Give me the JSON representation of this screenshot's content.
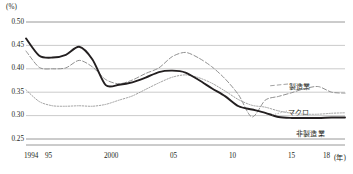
{
  "chart_data": {
    "type": "line",
    "title": "",
    "unit_label": "(%)",
    "xlabel": "(年)",
    "ylabel": "",
    "ylim": [
      0.25,
      0.5
    ],
    "ytick_labels": [
      "0.50",
      "0.45",
      "0.40",
      "0.35",
      "0.30",
      "0.25"
    ],
    "ytick_values": [
      0.5,
      0.45,
      0.4,
      0.35,
      0.3,
      0.25
    ],
    "grid": true,
    "legend_position": "inline-right",
    "xlim": [
      1994,
      2018
    ],
    "x": [
      1994,
      1995,
      1996,
      1997,
      1998,
      1999,
      2000,
      2001,
      2002,
      2003,
      2004,
      2005,
      2006,
      2007,
      2008,
      2009,
      2010,
      2011,
      2012,
      2013,
      2014,
      2015,
      2016,
      2017,
      2018
    ],
    "xtick_labels": [
      "1994",
      "95",
      "2000",
      "05",
      "10",
      "15",
      "18"
    ],
    "xtick_values": [
      1994,
      1995,
      2000,
      2005,
      2010,
      2015,
      2018
    ],
    "xtick_suffix": "(年)",
    "series": [
      {
        "name": "製造業",
        "style": "dashed",
        "color": "#8a8a8a",
        "values": [
          0.438,
          0.403,
          0.4,
          0.402,
          0.418,
          0.404,
          0.377,
          0.368,
          0.376,
          0.39,
          0.402,
          0.426,
          0.435,
          0.423,
          0.404,
          0.378,
          0.344,
          0.297,
          0.333,
          0.341,
          0.349,
          0.358,
          0.362,
          0.35,
          0.348
        ]
      },
      {
        "name": "マクロ",
        "style": "solid",
        "color": "#231f20",
        "values": [
          0.465,
          0.428,
          0.424,
          0.43,
          0.447,
          0.42,
          0.365,
          0.366,
          0.371,
          0.381,
          0.393,
          0.396,
          0.392,
          0.376,
          0.358,
          0.341,
          0.32,
          0.313,
          0.306,
          0.297,
          0.295,
          0.295,
          0.295,
          0.296,
          0.296
        ]
      },
      {
        "name": "非製造業",
        "style": "dotted",
        "color": "#9a9a9a",
        "values": [
          0.355,
          0.33,
          0.321,
          0.32,
          0.321,
          0.32,
          0.324,
          0.333,
          0.342,
          0.356,
          0.37,
          0.382,
          0.387,
          0.381,
          0.369,
          0.352,
          0.334,
          0.322,
          0.318,
          0.31,
          0.305,
          0.303,
          0.303,
          0.305,
          0.306
        ]
      }
    ]
  },
  "labels": {
    "manufacturing": "製造業",
    "macro": "マクロ",
    "nonmanufacturing": "非製造業"
  }
}
